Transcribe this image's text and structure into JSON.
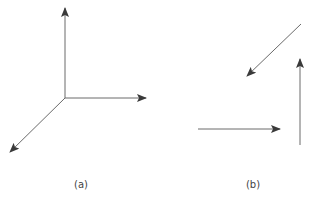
{
  "figure": {
    "stroke_color": "#6a6a6a",
    "arrowhead_color": "#3a3a3a",
    "panels": [
      {
        "id": "a",
        "label": "(a)",
        "label_pos": [
          81,
          180
        ],
        "description": "Three vectors drawn tail-to-tail from a common origin",
        "arrows": [
          {
            "name": "up-vector",
            "from": [
              65,
              98
            ],
            "to": [
              65,
              8
            ]
          },
          {
            "name": "right-vector",
            "from": [
              65,
              98
            ],
            "to": [
              146,
              98
            ]
          },
          {
            "name": "down-left-vector",
            "from": [
              65,
              98
            ],
            "to": [
              10,
              152
            ]
          }
        ]
      },
      {
        "id": "b",
        "label": "(b)",
        "label_pos": [
          253,
          180
        ],
        "description": "The same three vectors drawn separately",
        "arrows": [
          {
            "name": "down-left-vector",
            "from": [
              301,
              24
            ],
            "to": [
              247,
              76
            ]
          },
          {
            "name": "right-vector",
            "from": [
              198,
              129
            ],
            "to": [
              280,
              129
            ]
          },
          {
            "name": "up-vector",
            "from": [
              300,
              145
            ],
            "to": [
              300,
              59
            ]
          }
        ]
      }
    ]
  }
}
